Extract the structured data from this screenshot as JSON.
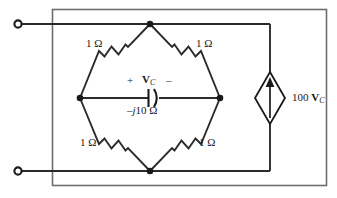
{
  "figure": {
    "type": "circuit-schematic",
    "width": 337,
    "height": 198,
    "stroke_color": "#2b2b2b",
    "box_color": "#6e6e6e",
    "background": "#ffffff"
  },
  "terminals": {
    "top": {
      "name": "top-terminal",
      "x": 18,
      "y": 24
    },
    "bottom": {
      "name": "bottom-terminal",
      "x": 18,
      "y": 171
    }
  },
  "bridge": {
    "nodes": {
      "top": {
        "x": 150,
        "y": 24
      },
      "left": {
        "x": 80,
        "y": 98
      },
      "right": {
        "x": 220,
        "y": 98
      },
      "bottom": {
        "x": 150,
        "y": 171
      }
    },
    "arms": [
      {
        "name": "resistor-top-left",
        "label": "1 Ω",
        "label_x": 86,
        "label_y": 44
      },
      {
        "name": "resistor-top-right",
        "label": "1 Ω",
        "label_x": 196,
        "label_y": 44
      },
      {
        "name": "resistor-bottom-left",
        "label": "1 Ω",
        "label_x": 86,
        "label_y": 143
      },
      {
        "name": "resistor-bottom-right",
        "label": "1 Ω",
        "label_x": 196,
        "label_y": 143
      }
    ]
  },
  "capacitor": {
    "name": "capacitor-branch",
    "impedance_label": {
      "prefix": "–",
      "italic": "j",
      "suffix": "10 Ω"
    },
    "impedance_text": "–j10 Ω",
    "polarity_plus": "+",
    "polarity_minus": "–",
    "voltage_symbol": "V",
    "voltage_subscript": "C",
    "voltage_label": "Vₑ"
  },
  "source": {
    "name": "dependent-current-source",
    "gain": "100",
    "variable": "V",
    "variable_subscript": "C",
    "label_text": "100 V",
    "direction": "up"
  },
  "units": {
    "ohm": "Ω"
  }
}
